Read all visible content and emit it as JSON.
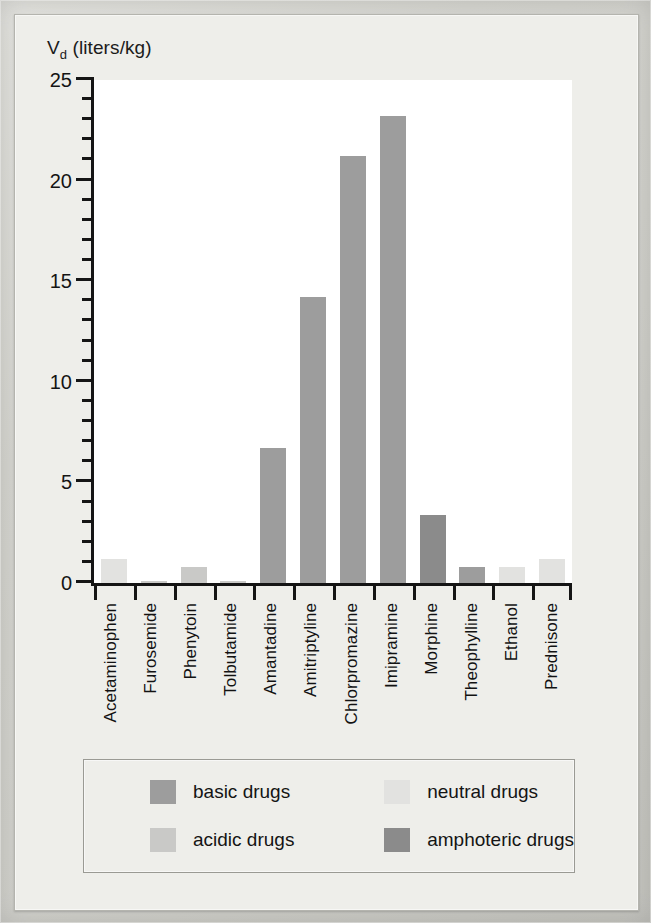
{
  "figure": {
    "yaxis_title_main": "V",
    "yaxis_title_sub": "d",
    "yaxis_title_units": " (liters/kg)"
  },
  "chart_data": {
    "type": "bar",
    "title": "",
    "xlabel": "",
    "ylabel": "Vd (liters/kg)",
    "ylim": [
      0,
      25
    ],
    "ytick_major": [
      0,
      5,
      10,
      15,
      20,
      25
    ],
    "ytick_minor_step": 1,
    "grid": false,
    "legend_position": "bottom",
    "categories": [
      "Acetaminophen",
      "Furosemide",
      "Phenytoin",
      "Tolbutamide",
      "Amantadine",
      "Amitriptyline",
      "Chlorpromazine",
      "Imipramine",
      "Morphine",
      "Theophylline",
      "Ethanol",
      "Prednisone"
    ],
    "values": [
      1.2,
      0.1,
      0.8,
      0.1,
      6.7,
      14.2,
      21.2,
      23.2,
      3.4,
      0.8,
      0.8,
      1.2
    ],
    "point_classes": [
      "neutral",
      "acidic",
      "acidic",
      "acidic",
      "basic",
      "basic",
      "basic",
      "basic",
      "amphoteric",
      "basic",
      "neutral",
      "neutral"
    ],
    "series": [
      {
        "name": "Vd (liters/kg)",
        "values": [
          1.2,
          0.1,
          0.8,
          0.1,
          6.7,
          14.2,
          21.2,
          23.2,
          3.4,
          0.8,
          0.8,
          1.2
        ]
      }
    ],
    "legend": [
      {
        "label": "basic drugs",
        "key": "basic",
        "color": "#9d9d9d"
      },
      {
        "label": "neutral drugs",
        "key": "neutral",
        "color": "#e2e2e0"
      },
      {
        "label": "acidic drugs",
        "key": "acidic",
        "color": "#c9c9c7"
      },
      {
        "label": "amphoteric drugs",
        "key": "amphoteric",
        "color": "#8b8b8b"
      }
    ],
    "class_colors": {
      "basic": "#9d9d9d",
      "neutral": "#e2e2e0",
      "acidic": "#c9c9c7",
      "amphoteric": "#8b8b8b"
    }
  }
}
